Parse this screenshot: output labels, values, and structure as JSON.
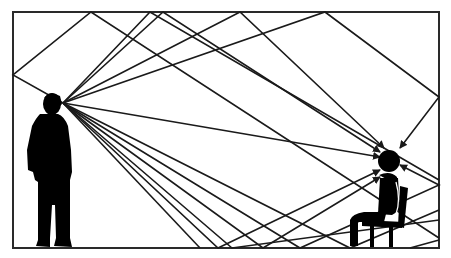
{
  "diagram": {
    "type": "acoustic-reflection",
    "colors": {
      "line": "#1a1a1a",
      "figure": "#000000",
      "background": "#ffffff",
      "frame": "#2a2a2a"
    },
    "room": {
      "x": 13,
      "y": 12,
      "width": 426,
      "height": 236
    },
    "speaker": {
      "label": "",
      "mouth": [
        63,
        103
      ]
    },
    "listener": {
      "label": "",
      "head": [
        389,
        161
      ]
    },
    "rays": [
      {
        "kind": "direct",
        "points": [
          [
            63,
            103
          ],
          [
            380,
            157
          ]
        ]
      },
      {
        "kind": "ceiling",
        "points": [
          [
            63,
            103
          ],
          [
            163,
            12
          ],
          [
            380,
            152
          ]
        ]
      },
      {
        "kind": "ceiling",
        "points": [
          [
            63,
            103
          ],
          [
            240,
            12
          ],
          [
            384,
            148
          ]
        ]
      },
      {
        "kind": "ceiling-wall",
        "points": [
          [
            63,
            103
          ],
          [
            325,
            12
          ],
          [
            439,
            97
          ],
          [
            400,
            148
          ]
        ]
      },
      {
        "kind": "wall-ceiling",
        "points": [
          [
            63,
            103
          ],
          [
            13,
            75
          ],
          [
            91,
            12
          ],
          [
            439,
            238
          ]
        ]
      },
      {
        "kind": "ceiling-steep",
        "points": [
          [
            63,
            103
          ],
          [
            150,
            12
          ],
          [
            439,
            180
          ]
        ]
      },
      {
        "kind": "floor",
        "points": [
          [
            63,
            103
          ],
          [
            218,
            248
          ],
          [
            380,
            170
          ]
        ]
      },
      {
        "kind": "floor",
        "points": [
          [
            63,
            103
          ],
          [
            263,
            248
          ],
          [
            380,
            177
          ]
        ]
      },
      {
        "kind": "floor",
        "points": [
          [
            63,
            103
          ],
          [
            232,
            248
          ],
          [
            439,
            220
          ]
        ]
      },
      {
        "kind": "floor",
        "points": [
          [
            63,
            103
          ],
          [
            200,
            248
          ]
        ]
      },
      {
        "kind": "floor-wall",
        "points": [
          [
            63,
            103
          ],
          [
            300,
            248
          ],
          [
            439,
            185
          ],
          [
            400,
            165
          ]
        ]
      },
      {
        "kind": "floor-wall",
        "points": [
          [
            63,
            103
          ],
          [
            350,
            248
          ],
          [
            439,
            210
          ]
        ]
      },
      {
        "kind": "wall-floor",
        "points": [
          [
            439,
            240
          ],
          [
            410,
            248
          ]
        ]
      }
    ]
  }
}
